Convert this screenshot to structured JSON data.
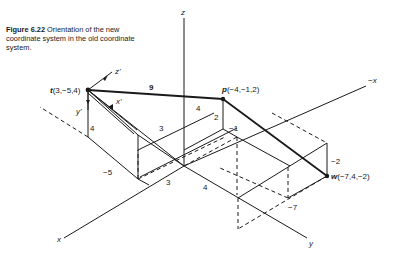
{
  "caption": {
    "label": "Figure 6.22",
    "text": "Orientation of the new coordinate system in the old coordinate system."
  },
  "axes": {
    "z": "z",
    "x": "x",
    "neg_x": "−x",
    "y": "y"
  },
  "points": {
    "t": {
      "name": "t",
      "coords": "(3,−5,4)"
    },
    "p": {
      "name": "p",
      "coords": "(−4,−1,2)"
    },
    "w": {
      "name": "w",
      "coords": "(−7,4,−2)"
    }
  },
  "new_axes": {
    "x_prime": "x'",
    "y_prime": "y'",
    "z_prime": "z'"
  },
  "distances": {
    "t_to_p": "9"
  },
  "dimension_labels": {
    "t_height": "4",
    "t_x": "3",
    "t_y": "−5",
    "origin_x": "3",
    "origin_y": "4",
    "p_x": "4",
    "p_height": "2",
    "p_y": "−1",
    "w_height": "−2",
    "w_x": "−7"
  }
}
